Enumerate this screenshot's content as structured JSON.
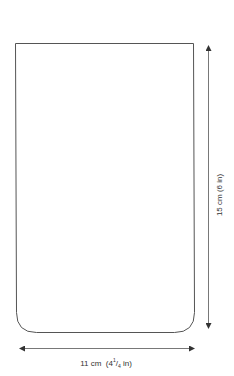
{
  "diagram": {
    "shape": {
      "type": "rectangle-rounded-bottom",
      "stroke_color": "#555555",
      "top_left": [
        15.5,
        43.5
      ],
      "top_right": [
        193.5,
        43.5
      ],
      "bottom_y": 332.5,
      "bottom_corner_radius": 20
    },
    "dimensions": {
      "width": {
        "label_cm": "11 cm",
        "label_in_whole": "4",
        "label_in_num": "1",
        "label_in_den": "4",
        "label_in_unit": "in",
        "label_full": "11 cm  (4¼ in)",
        "arrow_y": 348,
        "arrow_x_start": 18,
        "arrow_x_end": 196
      },
      "height": {
        "label_full": "15 cm (6 in)",
        "arrow_x": 208,
        "arrow_y_start": 43,
        "arrow_y_end": 330
      }
    },
    "colors": {
      "line": "#555555",
      "arrow": "#333333",
      "text": "#333333",
      "background": "#ffffff"
    }
  }
}
